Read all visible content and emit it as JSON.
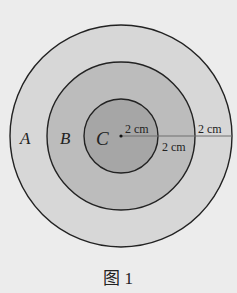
{
  "figure": {
    "caption": "图 1",
    "center": {
      "x": 121,
      "y": 136
    },
    "regions": [
      {
        "id": "A",
        "label": "A",
        "radius_px": 111,
        "fill": "#d7d7d7"
      },
      {
        "id": "B",
        "label": "B",
        "radius_px": 74,
        "fill": "#bcbcbc"
      },
      {
        "id": "C",
        "label": "C",
        "radius_px": 37,
        "fill": "#a6a6a6"
      }
    ],
    "measurements": [
      {
        "id": "inner",
        "text": "2 cm"
      },
      {
        "id": "middle",
        "text": "2 cm"
      },
      {
        "id": "outer",
        "text": "2 cm"
      }
    ],
    "stroke_color": "#222222",
    "radius_line_color": "#6e6e6e",
    "background": "#ececec"
  }
}
